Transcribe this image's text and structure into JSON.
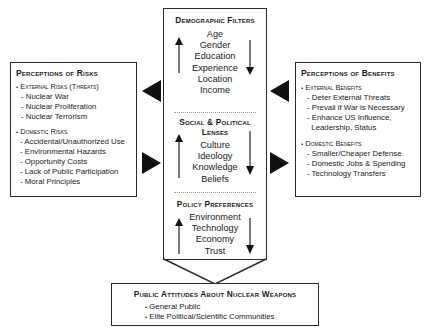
{
  "risks": {
    "title": "Perceptions of Risks",
    "external": {
      "label": "External Risks (Threats)",
      "items": [
        "- Nuclear War",
        "- Nuclear Proliferation",
        "- Nuclear Terrorism"
      ]
    },
    "domestic": {
      "label": "Domestic Risks",
      "items": [
        "- Accidental/Unauthorized Use",
        "- Environmental Hazards",
        "- Opportunity Costs",
        "- Lack of Public Participation",
        "- Moral Principles"
      ]
    }
  },
  "filters": {
    "demographic": {
      "title": "Demographic Filters",
      "items": [
        "Age",
        "Gender",
        "Education",
        "Experience",
        "Location",
        "Income"
      ]
    },
    "social": {
      "title_line1": "Social & Political",
      "title_line2": "Lenses",
      "items": [
        "Culture",
        "Ideology",
        "Knowledge",
        "Beliefs"
      ]
    },
    "policy": {
      "title": "Policy Preferences",
      "items": [
        "Environment",
        "Technology",
        "Economy",
        "Trust"
      ]
    }
  },
  "benefits": {
    "title": "Perceptions of Benefits",
    "external": {
      "label": "External Benefits",
      "items": [
        "- Deter External Threats",
        "- Prevail if War is Necessary",
        "- Enhance US Influence,",
        "  Leadership, Status"
      ]
    },
    "domestic": {
      "label": "Domestic Benefits",
      "items": [
        "- Smaller/Cheaper Defense",
        "- Domestic Jobs & Spending",
        "- Technology Transfers"
      ]
    }
  },
  "attitudes": {
    "title": "Public Attitudes About Nuclear Weapons",
    "items": [
      "General Public",
      "Elite Political/Scientific Communities"
    ]
  },
  "bullet": "•"
}
